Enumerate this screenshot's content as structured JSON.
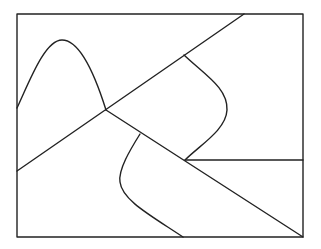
{
  "diagram": {
    "width": 321,
    "height": 249,
    "stroke_color": "#222222",
    "background": "#ffffff",
    "frame": {
      "x": 17,
      "y": 14,
      "w": 286,
      "h": 223
    },
    "paths": [
      {
        "name": "diagonal-line-up",
        "d": "M17,171 L244,14"
      },
      {
        "name": "diagonal-line-down",
        "d": "M106,110 L303,237"
      },
      {
        "name": "bell-curve",
        "d": "M17,108 C30,80 45,40 62,40 C80,40 95,75 106,110"
      },
      {
        "name": "upper-s-curve",
        "d": "M184,55 C205,75 228,88 227,110 C226,130 200,145 185,160"
      },
      {
        "name": "horizontal-line",
        "d": "M185,160 L303,160"
      },
      {
        "name": "lower-s-curve",
        "d": "M140,134 C130,150 118,170 120,182 C122,200 150,215 183,237"
      }
    ]
  }
}
